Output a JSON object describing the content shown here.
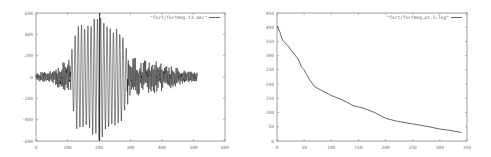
{
  "chart_data": [
    {
      "type": "line",
      "title": "",
      "xlabel": "",
      "ylabel": "",
      "legend": [
        "\"fort/fortmeg.t3.asc\""
      ],
      "legend_position": "top-right",
      "grid": false,
      "xlim": [
        0,
        600
      ],
      "ylim": [
        -600,
        600
      ],
      "x_ticks": [
        "0",
        "100",
        "200",
        "300",
        "400",
        "500",
        "600"
      ],
      "y_ticks": [
        "600",
        "400",
        "200",
        "0",
        "-200",
        "-400",
        "-600"
      ],
      "series": [
        {
          "name": "\"fort/fortmeg.t3.asc\"",
          "color": "#000000",
          "description": "oscillating seismic-like waveform, x from 0 to ~512; envelope small (~±50) at 0–60, growing to ~±150 near 80–100, large amplitude burst (~±500–600) between ~110 and ~280 peaking near 200–210, decaying to ~±100–200 from 300–400 and ~±50 by 500",
          "envelope": {
            "x": [
              0,
              50,
              90,
              110,
              130,
              160,
              200,
              210,
              240,
              270,
              290,
              320,
              350,
              400,
              450,
              512
            ],
            "amp": [
              40,
              60,
              150,
              200,
              520,
              500,
              600,
              580,
              480,
              450,
              250,
              200,
              160,
              130,
              80,
              40
            ]
          }
        }
      ]
    },
    {
      "type": "line",
      "title": "",
      "xlabel": "",
      "ylabel": "",
      "legend": [
        "\"fort/fortmeg.pt.5.log\""
      ],
      "legend_position": "top-right",
      "grid": false,
      "xlim": [
        0,
        350
      ],
      "ylim": [
        0,
        450
      ],
      "x_ticks": [
        "0",
        "50",
        "100",
        "150",
        "200",
        "250",
        "300",
        "350"
      ],
      "y_ticks": [
        "0",
        "50",
        "100",
        "150",
        "200",
        "250",
        "300",
        "350",
        "400",
        "450"
      ],
      "series": [
        {
          "name": "\"fort/fortmeg.pt.5.log\"",
          "color": "#000000",
          "x": [
            0,
            5,
            10,
            20,
            30,
            40,
            45,
            50,
            60,
            70,
            80,
            90,
            100,
            120,
            140,
            160,
            180,
            200,
            220,
            250,
            280,
            300,
            320,
            340
          ],
          "y": [
            405,
            385,
            355,
            335,
            310,
            285,
            260,
            250,
            215,
            190,
            180,
            170,
            160,
            145,
            125,
            115,
            100,
            80,
            70,
            60,
            50,
            42,
            37,
            30
          ]
        }
      ]
    }
  ]
}
